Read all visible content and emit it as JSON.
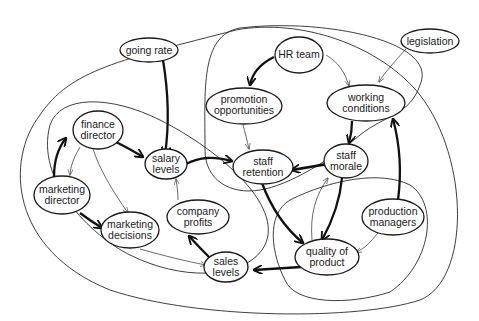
{
  "diagram": {
    "type": "multiple-cause / influence diagram",
    "nodes": [
      {
        "id": "going_rate",
        "label": [
          "going rate"
        ]
      },
      {
        "id": "hr_team",
        "label": [
          "HR team"
        ]
      },
      {
        "id": "legislation",
        "label": [
          "legislation"
        ]
      },
      {
        "id": "promotion_opportunities",
        "label": [
          "promotion",
          "opportunities"
        ]
      },
      {
        "id": "working_conditions",
        "label": [
          "working",
          "conditions"
        ]
      },
      {
        "id": "finance_director",
        "label": [
          "finance",
          "director"
        ]
      },
      {
        "id": "salary_levels",
        "label": [
          "salary",
          "levels"
        ]
      },
      {
        "id": "staff_retention",
        "label": [
          "staff",
          "retention"
        ]
      },
      {
        "id": "staff_morale",
        "label": [
          "staff",
          "morale"
        ]
      },
      {
        "id": "marketing_director",
        "label": [
          "marketing",
          "director"
        ]
      },
      {
        "id": "company_profits",
        "label": [
          "company",
          "profits"
        ]
      },
      {
        "id": "production_managers",
        "label": [
          "production",
          "managers"
        ]
      },
      {
        "id": "marketing_decisions",
        "label": [
          "marketing",
          "decisions"
        ]
      },
      {
        "id": "sales_levels",
        "label": [
          "sales",
          "levels"
        ]
      },
      {
        "id": "quality_of_product",
        "label": [
          "quality of",
          "product"
        ]
      }
    ],
    "edges": [
      {
        "from": "going_rate",
        "to": "salary_levels",
        "weight": "strong"
      },
      {
        "from": "hr_team",
        "to": "promotion_opportunities",
        "weight": "strong"
      },
      {
        "from": "hr_team",
        "to": "working_conditions",
        "weight": "weak"
      },
      {
        "from": "legislation",
        "to": "working_conditions",
        "weight": "weak"
      },
      {
        "from": "promotion_opportunities",
        "to": "staff_retention",
        "weight": "weak"
      },
      {
        "from": "working_conditions",
        "to": "staff_morale",
        "weight": "strong"
      },
      {
        "from": "finance_director",
        "to": "salary_levels",
        "weight": "strong"
      },
      {
        "from": "finance_director",
        "to": "marketing_director",
        "weight": "weak"
      },
      {
        "from": "finance_director",
        "to": "marketing_decisions",
        "weight": "weak"
      },
      {
        "from": "marketing_director",
        "to": "finance_director",
        "weight": "strong"
      },
      {
        "from": "marketing_director",
        "to": "marketing_decisions",
        "weight": "strong"
      },
      {
        "from": "salary_levels",
        "to": "staff_retention",
        "weight": "strong"
      },
      {
        "from": "staff_morale",
        "to": "staff_retention",
        "weight": "strong"
      },
      {
        "from": "staff_morale",
        "to": "quality_of_product",
        "weight": "strong"
      },
      {
        "from": "quality_of_product",
        "to": "staff_morale",
        "weight": "weak"
      },
      {
        "from": "staff_retention",
        "to": "quality_of_product",
        "weight": "strong"
      },
      {
        "from": "company_profits",
        "to": "salary_levels",
        "weight": "weak"
      },
      {
        "from": "sales_levels",
        "to": "company_profits",
        "weight": "strong"
      },
      {
        "from": "marketing_decisions",
        "to": "sales_levels",
        "weight": "weak"
      },
      {
        "from": "quality_of_product",
        "to": "sales_levels",
        "weight": "strong"
      },
      {
        "from": "production_managers",
        "to": "working_conditions",
        "weight": "strong"
      },
      {
        "from": "production_managers",
        "to": "quality_of_product",
        "weight": "weak"
      }
    ]
  }
}
